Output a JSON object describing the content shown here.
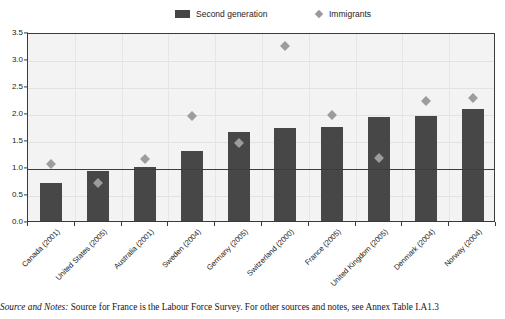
{
  "legend": {
    "items": [
      {
        "label": "Second generation",
        "marker": "bar-swatch-icon",
        "color": "#474747"
      },
      {
        "label": "Immigrants",
        "marker": "diamond-marker-icon",
        "color": "#9c9c9c"
      }
    ]
  },
  "footnote": {
    "lead": "Source and Notes:",
    "text": " Source for France is the Labour Force Survey. For other sources and notes, see Annex Table I.A1.3"
  },
  "chart_data": {
    "type": "bar",
    "title": "",
    "subtitle": "",
    "xlabel": "",
    "ylabel": "",
    "ylim": [
      0.0,
      3.5
    ],
    "ytick_step": 0.5,
    "ytick_labels": [
      "0.0",
      "0.5",
      "1.0",
      "1.5",
      "2.0",
      "2.5",
      "3.0",
      "3.5"
    ],
    "ytick_values": [
      0.0,
      0.5,
      1.0,
      1.5,
      2.0,
      2.5,
      3.0,
      3.5
    ],
    "grid": true,
    "legend_position": "top",
    "reference_line": {
      "value": 1.0,
      "label": ""
    },
    "categories": [
      "Canada (2001)",
      "United States (2005)",
      "Australia (2001)",
      "Sweden (2004)",
      "Germany (2005)",
      "Switzerland (2000)",
      "France (2005)",
      "United Kingdom (2005)",
      "Denmark (2004)",
      "Norway (2004)"
    ],
    "series": [
      {
        "name": "Second generation",
        "type": "bar",
        "color": "#474747",
        "values": [
          0.7,
          0.92,
          1.0,
          1.3,
          1.65,
          1.72,
          1.74,
          1.92,
          1.95,
          2.07
        ]
      },
      {
        "name": "Immigrants",
        "type": "scatter",
        "color": "#9c9c9c",
        "values": [
          1.05,
          0.7,
          1.15,
          1.95,
          1.44,
          3.25,
          1.96,
          1.16,
          2.23,
          2.27
        ]
      }
    ]
  }
}
